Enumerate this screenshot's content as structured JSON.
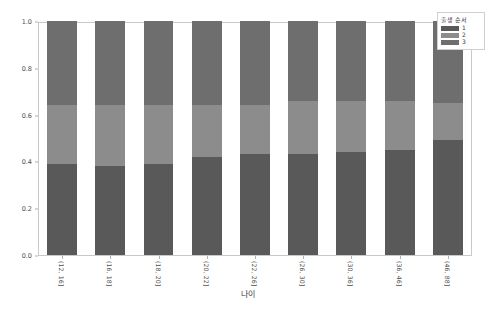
{
  "chart_data": {
    "type": "bar",
    "subtype": "stacked-100-percent",
    "title": "",
    "xlabel": "나이",
    "ylabel": "",
    "ylim": [
      0.0,
      1.0
    ],
    "yticks": [
      "0.0",
      "0.2",
      "0.4",
      "0.6",
      "0.8",
      "1.0"
    ],
    "ytick_values": [
      0.0,
      0.2,
      0.4,
      0.6,
      0.8,
      1.0
    ],
    "grid": false,
    "legend_position": "upper-right-outside",
    "legend_title": "출생 순서",
    "categories": [
      "(12, 16]",
      "(16, 18]",
      "(18, 20]",
      "(20, 22]",
      "(22, 26]",
      "(26, 30]",
      "(30, 36]",
      "(36, 46]",
      "(46, 88]"
    ],
    "series": [
      {
        "name": "1",
        "color": "#595959",
        "values": [
          0.39,
          0.38,
          0.39,
          0.42,
          0.43,
          0.43,
          0.44,
          0.45,
          0.49
        ]
      },
      {
        "name": "2",
        "color": "#8c8c8c",
        "values": [
          0.25,
          0.26,
          0.25,
          0.22,
          0.21,
          0.23,
          0.22,
          0.21,
          0.16
        ]
      },
      {
        "name": "3",
        "color": "#6e6e6e",
        "values": [
          0.36,
          0.36,
          0.36,
          0.36,
          0.36,
          0.34,
          0.34,
          0.34,
          0.35
        ]
      }
    ],
    "cumulative_tops": {
      "segment1": [
        0.39,
        0.38,
        0.39,
        0.42,
        0.43,
        0.43,
        0.44,
        0.45,
        0.49
      ],
      "segment2": [
        0.64,
        0.64,
        0.64,
        0.64,
        0.64,
        0.66,
        0.66,
        0.66,
        0.65
      ],
      "segment3": [
        1.0,
        1.0,
        1.0,
        1.0,
        1.0,
        1.0,
        1.0,
        1.0,
        1.0
      ]
    }
  },
  "legend": {
    "title": "출생 순서",
    "items": [
      {
        "label": "1",
        "color": "#595959"
      },
      {
        "label": "2",
        "color": "#8c8c8c"
      },
      {
        "label": "3",
        "color": "#6e6e6e"
      }
    ]
  },
  "axes": {
    "x_title": "나이",
    "y_ticks": [
      "0.0",
      "0.2",
      "0.4",
      "0.6",
      "0.8",
      "1.0"
    ],
    "x_tick_labels": [
      "(12, 16]",
      "(16, 18]",
      "(18, 20]",
      "(20, 22]",
      "(22, 26]",
      "(26, 30]",
      "(30, 36]",
      "(36, 46]",
      "(46, 88]"
    ]
  },
  "style": {
    "plot_border": "#c9c9c9",
    "tick_color": "#b0b0b0",
    "text_color": "#4d4d4d",
    "background": "#ffffff"
  }
}
